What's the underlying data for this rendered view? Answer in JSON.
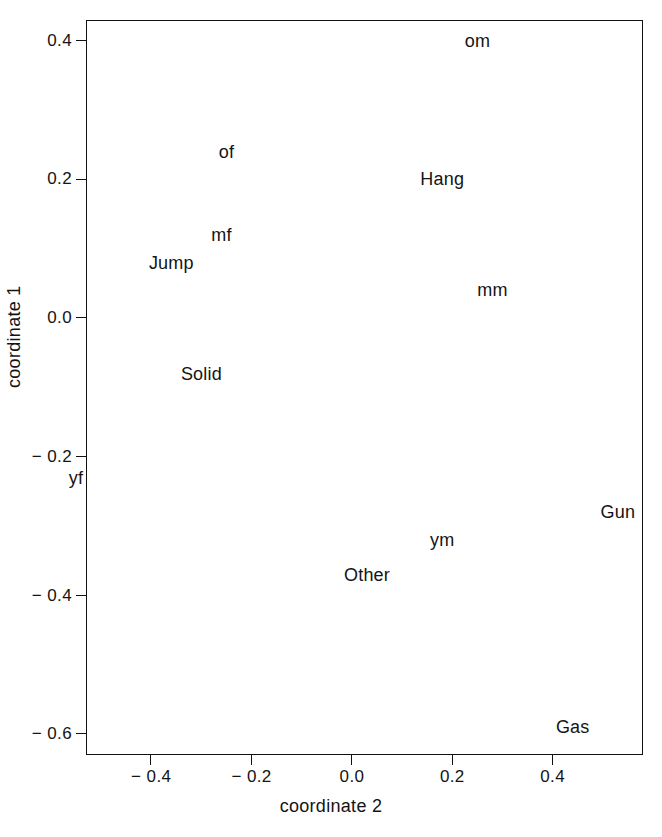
{
  "chart_data": {
    "type": "scatter",
    "title": "",
    "xlabel": "coordinate 2",
    "ylabel": "coordinate 1",
    "xlim": [
      -0.53,
      0.58
    ],
    "ylim": [
      -0.63,
      0.43
    ],
    "grid": false,
    "legend": "none",
    "marker_style": "text-label",
    "xticks": [
      -0.4,
      -0.2,
      0.0,
      0.2,
      0.4
    ],
    "xticklabels": [
      "− 0.4",
      "− 0.2",
      "0.0",
      "0.2",
      "0.4"
    ],
    "yticks": [
      0.4,
      0.2,
      0.0,
      -0.2,
      -0.4,
      -0.6
    ],
    "yticklabels": [
      "0.4",
      "0.2",
      "0.0",
      "− 0.2",
      "− 0.4",
      "− 0.6"
    ],
    "points": [
      {
        "label": "om",
        "x": 0.25,
        "y": 0.4
      },
      {
        "label": "of",
        "x": -0.25,
        "y": 0.24
      },
      {
        "label": "Hang",
        "x": 0.18,
        "y": 0.2
      },
      {
        "label": "mf",
        "x": -0.26,
        "y": 0.12
      },
      {
        "label": "Jump",
        "x": -0.36,
        "y": 0.08
      },
      {
        "label": "mm",
        "x": 0.28,
        "y": 0.04
      },
      {
        "label": "Solid",
        "x": -0.3,
        "y": -0.08
      },
      {
        "label": "yf",
        "x": -0.55,
        "y": -0.23
      },
      {
        "label": "Gun",
        "x": 0.53,
        "y": -0.28
      },
      {
        "label": "ym",
        "x": 0.18,
        "y": -0.32
      },
      {
        "label": "Other",
        "x": 0.03,
        "y": -0.37
      },
      {
        "label": "Gas",
        "x": 0.44,
        "y": -0.59
      }
    ]
  },
  "style": {
    "axis_color": "#111111",
    "text_color": "#141414",
    "background": "#ffffff"
  }
}
